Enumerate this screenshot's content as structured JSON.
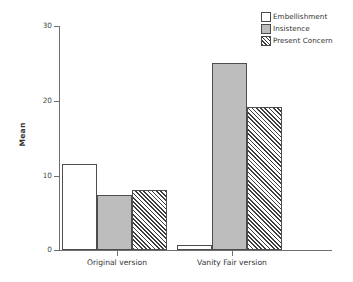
{
  "chart_data": {
    "type": "bar",
    "title": "",
    "xlabel": "",
    "ylabel": "Mean",
    "ylim": [
      0,
      30
    ],
    "yticks": [
      0,
      10,
      20,
      30
    ],
    "ytick_labels": [
      "0",
      "10",
      "20",
      "30"
    ],
    "grid": false,
    "legend_position": "top-right",
    "categories": [
      "Original version",
      "Vanity Fair version"
    ],
    "series": [
      {
        "name": "Embellishment",
        "fill": "white",
        "values": [
          11.5,
          0.7
        ]
      },
      {
        "name": "Insistence",
        "fill": "gray",
        "values": [
          7.4,
          25.0
        ]
      },
      {
        "name": "Present Concern",
        "fill": "hatch",
        "values": [
          8.1,
          19.2
        ]
      }
    ]
  },
  "legend": {
    "items": [
      {
        "label": "Embellishment",
        "swatch": "white-square-swatch"
      },
      {
        "label": "Insistence",
        "swatch": "gray-square-swatch"
      },
      {
        "label": "Present Concern",
        "swatch": "hatched-square-swatch"
      }
    ]
  },
  "axes": {
    "y_axis_label": "Mean",
    "y_tick_labels": [
      "30",
      "20",
      "10",
      "0"
    ],
    "x_tick_labels": [
      "Original version",
      "Vanity Fair version"
    ]
  },
  "colors": {
    "axis": "#6e6e6e",
    "bar_outline": "#4d4d4d",
    "gray_fill": "#bdbdbd",
    "hatch_stroke": "#3d3d3d",
    "text": "#333333",
    "background": "#ffffff"
  }
}
